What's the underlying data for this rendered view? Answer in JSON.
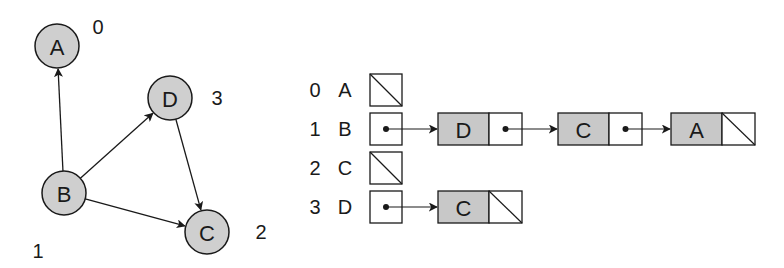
{
  "colors": {
    "background": "#ffffff",
    "node_fill": "#cfcfcf",
    "list_node_fill": "#c8c8c8",
    "stroke": "#1a1a1a"
  },
  "graph": {
    "nodes": [
      {
        "id": "A",
        "label": "A",
        "index": "0",
        "cx": 57,
        "cy": 46,
        "index_x": 98,
        "index_y": 27
      },
      {
        "id": "B",
        "label": "B",
        "index": "1",
        "cx": 64,
        "cy": 193,
        "index_x": 38,
        "index_y": 251
      },
      {
        "id": "C",
        "label": "C",
        "index": "2",
        "cx": 207,
        "cy": 232,
        "index_x": 261,
        "index_y": 232
      },
      {
        "id": "D",
        "label": "D",
        "index": "3",
        "cx": 170,
        "cy": 98,
        "index_x": 217,
        "index_y": 98
      }
    ],
    "edges": [
      {
        "from": "B",
        "to": "A"
      },
      {
        "from": "B",
        "to": "D"
      },
      {
        "from": "B",
        "to": "C"
      },
      {
        "from": "D",
        "to": "C"
      }
    ]
  },
  "adjacency_list": {
    "rows": [
      {
        "index": "0",
        "vertex": "A",
        "list": []
      },
      {
        "index": "1",
        "vertex": "B",
        "list": [
          "D",
          "C",
          "A"
        ]
      },
      {
        "index": "2",
        "vertex": "C",
        "list": []
      },
      {
        "index": "3",
        "vertex": "D",
        "list": [
          "C"
        ]
      }
    ]
  }
}
